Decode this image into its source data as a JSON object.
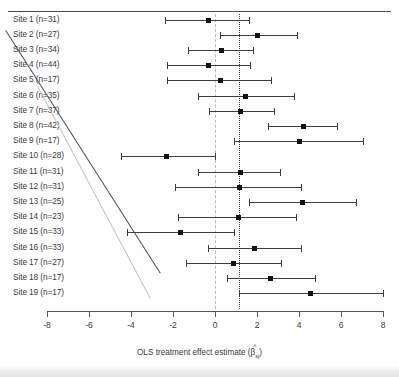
{
  "figure": {
    "title": "",
    "xaxis_title_prefix": "OLS treatment effect estimate (",
    "xaxis_title_symbol": "β",
    "xaxis_title_hat": "^",
    "xaxis_title_subscript": "sj",
    "xaxis_title_suffix": ")"
  },
  "chart_data": {
    "type": "scatter",
    "subtype": "forest-plot",
    "title": "",
    "xlabel": "OLS treatment effect estimate (β̂sj)",
    "ylabel": "",
    "xlim": [
      -8.8,
      8.4
    ],
    "ylim": [
      0,
      20
    ],
    "grid": false,
    "legend": "none",
    "xticks": [
      -8,
      -6,
      -4,
      -2,
      0,
      2,
      4,
      6,
      8
    ],
    "xticklabels": [
      "-8",
      "-6",
      "-4",
      "-2",
      "0",
      "2",
      "4",
      "6",
      "8"
    ],
    "reference_lines": [
      {
        "name": "null-effect",
        "x": 0,
        "style": "dashed",
        "color": "#b9b9b9"
      },
      {
        "name": "pooled-estimate",
        "x": 1.15,
        "style": "dotted",
        "color": "#3f3f3f"
      }
    ],
    "categories": [
      "Site 1 (n=31)",
      "Site 2 (n=27)",
      "Site 3 (n=34)",
      "Site 4 (n=44)",
      "Site 5 (n=17)",
      "Site 6 (n=35)",
      "Site 7 (n=37)",
      "Site 8 (n=42)",
      "Site 9 (n=17)",
      "Site 10 (n=28)",
      "Site 11 (n=31)",
      "Site 12 (n=31)",
      "Site 13 (n=25)",
      "Site 14 (n=23)",
      "Site 15 (n=33)",
      "Site 16 (n=33)",
      "Site 17 (n=27)",
      "Site 18 (n=17)",
      "Site 19 (n=17)"
    ],
    "points": [
      {
        "label": "Site 1 (n=31)",
        "site": 1,
        "n": 31,
        "estimate": -0.3,
        "ci_low": -2.4,
        "ci_high": 1.6
      },
      {
        "label": "Site 2 (n=27)",
        "site": 2,
        "n": 27,
        "estimate": 2.0,
        "ci_low": 0.25,
        "ci_high": 3.9
      },
      {
        "label": "Site 3 (n=34)",
        "site": 3,
        "n": 34,
        "estimate": 0.3,
        "ci_low": -1.3,
        "ci_high": 1.8
      },
      {
        "label": "Site 4 (n=44)",
        "site": 4,
        "n": 44,
        "estimate": -0.3,
        "ci_low": -2.3,
        "ci_high": 1.65
      },
      {
        "label": "Site 5 (n=17)",
        "site": 5,
        "n": 17,
        "estimate": 0.25,
        "ci_low": -2.3,
        "ci_high": 2.65
      },
      {
        "label": "Site 6 (n=35)",
        "site": 6,
        "n": 35,
        "estimate": 1.45,
        "ci_low": -0.8,
        "ci_high": 3.75
      },
      {
        "label": "Site 7 (n=37)",
        "site": 7,
        "n": 37,
        "estimate": 1.2,
        "ci_low": -0.3,
        "ci_high": 2.8
      },
      {
        "label": "Site 8 (n=42)",
        "site": 8,
        "n": 42,
        "estimate": 4.2,
        "ci_low": 2.5,
        "ci_high": 5.8
      },
      {
        "label": "Site 9 (n=17)",
        "site": 9,
        "n": 17,
        "estimate": 4.0,
        "ci_low": 0.9,
        "ci_high": 7.05
      },
      {
        "label": "Site 10 (n=28)",
        "site": 10,
        "n": 28,
        "estimate": -2.3,
        "ci_low": -4.5,
        "ci_high": 0.0
      },
      {
        "label": "Site 11 (n=31)",
        "site": 11,
        "n": 31,
        "estimate": 1.2,
        "ci_low": -0.8,
        "ci_high": 3.1
      },
      {
        "label": "Site 12 (n=31)",
        "site": 12,
        "n": 31,
        "estimate": 1.15,
        "ci_low": -1.9,
        "ci_high": 4.1
      },
      {
        "label": "Site 13 (n=25)",
        "site": 13,
        "n": 25,
        "estimate": 4.15,
        "ci_low": 1.6,
        "ci_high": 6.7
      },
      {
        "label": "Site 14 (n=23)",
        "site": 14,
        "n": 23,
        "estimate": 1.1,
        "ci_low": -1.75,
        "ci_high": 3.85
      },
      {
        "label": "Site 15 (n=33)",
        "site": 15,
        "n": 33,
        "estimate": -1.65,
        "ci_low": -4.2,
        "ci_high": 0.9
      },
      {
        "label": "Site 16 (n=33)",
        "site": 16,
        "n": 33,
        "estimate": 1.9,
        "ci_low": -0.35,
        "ci_high": 4.1
      },
      {
        "label": "Site 17 (n=27)",
        "site": 17,
        "n": 27,
        "estimate": 0.9,
        "ci_low": -1.4,
        "ci_high": 3.15
      },
      {
        "label": "Site 18 (n=17)",
        "site": 18,
        "n": 17,
        "estimate": 2.65,
        "ci_low": 0.55,
        "ci_high": 4.75
      },
      {
        "label": "Site 19 (n=17)",
        "site": 19,
        "n": 17,
        "estimate": 4.55,
        "ci_low": 1.15,
        "ci_high": 8.0
      }
    ]
  },
  "colors": {
    "marker": "#111111",
    "ci": "#3d3d3d",
    "zero_line": "#b9b9b9",
    "pooled_line": "#3f3f3f",
    "text": "#3a3a3a",
    "axis": "#555555"
  }
}
